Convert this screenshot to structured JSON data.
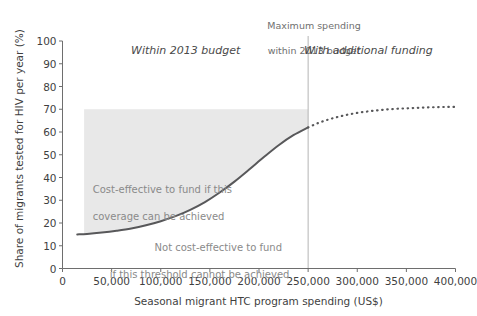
{
  "chart_data": {
    "type": "line",
    "title": "",
    "subtitle": "",
    "xlabel": "Seasonal migrant HTC program spending (US$)",
    "ylabel": "Share of migrants tested for HIV per year (%)",
    "xlim": [
      0,
      400000
    ],
    "ylim": [
      0,
      100
    ],
    "grid": false,
    "legend_position": "none",
    "xticks": [
      0,
      50000,
      100000,
      150000,
      200000,
      250000,
      300000,
      350000,
      400000
    ],
    "xtick_labels": [
      "0",
      "50,000",
      "100,000",
      "150,000",
      "200,000",
      "250,000",
      "300,000",
      "350,000",
      "400,000"
    ],
    "yticks": [
      0,
      10,
      20,
      30,
      40,
      50,
      60,
      70,
      80,
      90,
      100
    ],
    "ytick_labels": [
      "0",
      "10",
      "20",
      "30",
      "40",
      "50",
      "60",
      "70",
      "80",
      "90",
      "100"
    ],
    "series": [
      {
        "name": "Coverage achieved within 2013 budget",
        "style": "solid",
        "color": "#58585a",
        "x": [
          15000,
          25000,
          40000,
          55000,
          70000,
          85000,
          100000,
          115000,
          130000,
          145000,
          160000,
          175000,
          190000,
          205000,
          220000,
          235000,
          250000
        ],
        "y": [
          15.0,
          15.2,
          15.8,
          16.6,
          17.6,
          19.0,
          20.8,
          23.0,
          25.8,
          29.2,
          33.4,
          38.2,
          43.5,
          49.0,
          54.2,
          58.6,
          62.0
        ]
      },
      {
        "name": "Coverage with additional funding (projected)",
        "style": "dotted",
        "color": "#58585a",
        "x": [
          250000,
          260000,
          270000,
          280000,
          290000,
          300000,
          310000,
          320000,
          330000,
          340000,
          350000,
          360000,
          370000,
          380000,
          390000,
          400000
        ],
        "y": [
          62.0,
          63.9,
          65.4,
          66.6,
          67.6,
          68.4,
          69.0,
          69.5,
          69.9,
          70.2,
          70.4,
          70.6,
          70.8,
          70.9,
          71.0,
          71.0
        ]
      }
    ],
    "shaded_region": {
      "name": "Cost-effective coverage band",
      "color": "#e8e8e8",
      "upper_bound_y": 70,
      "x_start": 22000,
      "x_end": 250000
    },
    "vertical_line": {
      "name": "Maximum spending within 2013 budget",
      "x": 250000,
      "color": "#b5b5b5"
    },
    "annotations": {
      "callout_max_spending_line1": "Maximum spending",
      "callout_max_spending_line2": "within 2013 budget",
      "region_left": "Within 2013 budget",
      "region_right": "With additional funding",
      "note_cost_effective_line1": "Cost-effective to fund if this",
      "note_cost_effective_line2": "coverage can be achieved",
      "note_not_cost_effective_line1": "Not cost-effective to fund",
      "note_not_cost_effective_line2": "if this threshold cannot be achieved"
    },
    "colors": {
      "background": "#ffffff",
      "axis": "#6e6e6e",
      "curve": "#58585a",
      "band": "#e8e8e8",
      "text": "#3f3f3f",
      "muted_text": "#8a8a8a"
    }
  }
}
